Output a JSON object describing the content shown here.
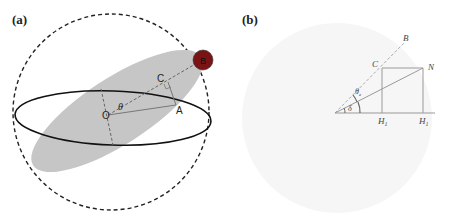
{
  "panel_a": {
    "label": "(a)",
    "points": {
      "O": "O",
      "C": "C",
      "A": "A",
      "B": "B"
    },
    "angle": "θ",
    "colors": {
      "ellipsoid": "#c8c8c8",
      "sphere": "#8a1a1a",
      "lines": "#222222"
    }
  },
  "panel_b": {
    "label": "(b)",
    "points": {
      "B": "B",
      "C": "C",
      "N": "N",
      "H1": "H",
      "H1_sub": "1",
      "H2": "H",
      "H2_sub": "1"
    },
    "angles": {
      "theta_e": "θ",
      "theta_e_sub": "e",
      "delta": "δ"
    },
    "colors": {
      "background_disc": "#f6f6f6",
      "lines": "#9a9a9a",
      "text": "#444444"
    }
  }
}
